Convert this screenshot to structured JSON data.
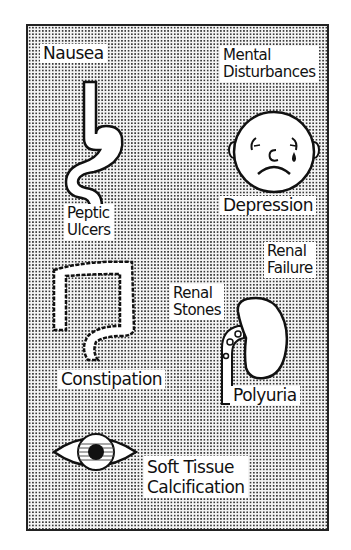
{
  "page_number": "",
  "labels": {
    "nausea": "Nausea",
    "mental": [
      "Mental",
      "Disturbances"
    ],
    "depression": "Depression",
    "peptic": [
      "Peptic",
      "Ulcers"
    ],
    "renal_failure": [
      "Renal",
      "Failure"
    ],
    "renal_stones": [
      "Renal",
      "Stones"
    ],
    "constipation": "Constipation",
    "polyuria": "Polyuria",
    "soft_tissue": [
      "Soft Tissue",
      "Calcification"
    ]
  },
  "icons": [
    "stomach-esophagus-icon",
    "sad-face-icon",
    "colon-icon",
    "kidney-icon",
    "eye-icon"
  ],
  "colors": {
    "ink": "#111111",
    "dot_pattern": "#3a3a3a",
    "label_bg": "#ffffff"
  }
}
